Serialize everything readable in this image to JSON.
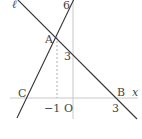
{
  "diagram": {
    "type": "coordinate-plane-lines",
    "axes": {
      "x_label": "x",
      "origin_label": "O",
      "x_ticks": [
        "-1",
        "3"
      ],
      "y_ticks": [
        "6",
        "3"
      ]
    },
    "lines": [
      {
        "name": "ℓ",
        "label": "ℓ",
        "through": [
          "A",
          "B"
        ]
      },
      {
        "name": "AC",
        "through": [
          "C",
          "A"
        ]
      }
    ],
    "points": [
      {
        "label": "A",
        "note": "intersection at x = -1, y = 3 level marker"
      },
      {
        "label": "B",
        "note": "on x-axis at x = 3"
      },
      {
        "label": "C",
        "note": "on x-axis, left of -1"
      }
    ],
    "labels": {
      "ell": "ℓ",
      "six": "6",
      "a": "A",
      "three_y": "3",
      "c": "C",
      "b": "B",
      "x": "x",
      "neg_one": "−1",
      "origin": "O",
      "three_x": "3"
    },
    "colors": {
      "line": "#333333",
      "axis": "#c8c8c8",
      "dashed": "#999999"
    }
  }
}
